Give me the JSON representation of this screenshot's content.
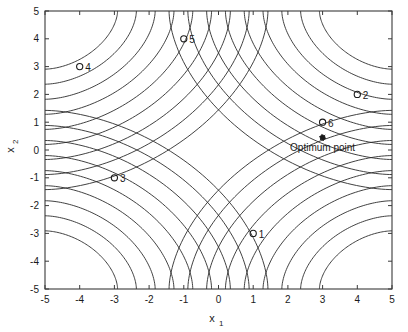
{
  "chart_data": {
    "type": "scatter",
    "title": "",
    "xlabel": "x_1",
    "ylabel": "x_2",
    "xlabel_base": "x",
    "xlabel_sub": "1",
    "ylabel_base": "x",
    "ylabel_sub": "2",
    "xlim": [
      -5,
      5
    ],
    "ylim": [
      -5,
      5
    ],
    "xticks": [
      -5,
      -4,
      -3,
      -2,
      -1,
      0,
      1,
      2,
      3,
      4,
      5
    ],
    "yticks": [
      -5,
      -4,
      -3,
      -2,
      -1,
      0,
      1,
      2,
      3,
      4,
      5
    ],
    "xtick_labels": [
      "-5",
      "-4",
      "-3",
      "-2",
      "-1",
      "0",
      "1",
      "2",
      "3",
      "4",
      "5"
    ],
    "ytick_labels": [
      "-5",
      "-4",
      "-3",
      "-2",
      "-1",
      "0",
      "1",
      "2",
      "3",
      "4",
      "5"
    ],
    "grid": false,
    "legend": null,
    "marker_style": "open-circle",
    "points": [
      {
        "id": "1",
        "label": "1",
        "x": 1.0,
        "y": -3.0
      },
      {
        "id": "2",
        "label": "2",
        "x": 4.0,
        "y": 2.0
      },
      {
        "id": "3",
        "label": "3",
        "x": -3.0,
        "y": -1.0
      },
      {
        "id": "4",
        "label": "4",
        "x": -4.0,
        "y": 3.0
      },
      {
        "id": "5",
        "label": "5",
        "x": -1.0,
        "y": 4.0
      },
      {
        "id": "6",
        "label": "6",
        "x": 3.0,
        "y": 1.0
      }
    ],
    "annotations": [
      {
        "name": "optimum-point",
        "text": "Optimum point",
        "x": 3.0,
        "y": 0.45,
        "marker": "filled-dot"
      }
    ],
    "contours": {
      "description": "nested hyperbolic level curves in the four corners",
      "corner_curve_count": 9,
      "stroke_color": "#2b2b2b"
    },
    "colors": {
      "background": "#ffffff",
      "axis": "#3a3a3a",
      "contour": "#2b2b2b",
      "marker": "#1a1a1a",
      "text": "#1a1a1a"
    }
  }
}
